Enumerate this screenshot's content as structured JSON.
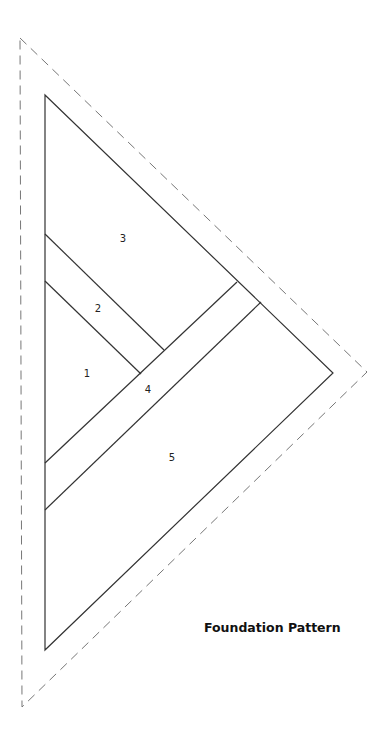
{
  "title": "Foundation Pattern",
  "colors": {
    "outline": "#333333",
    "seam_allowance": "#777777",
    "background": "#ffffff",
    "title_text": "#111111"
  },
  "outer_seam_allowance": {
    "style": "dashed",
    "points": "20,38 367,372 22,707"
  },
  "finished_outline": {
    "style": "solid",
    "points": "45,95 333,373 45,650"
  },
  "seam_lines": [
    {
      "id": "seam-3-2",
      "x1": 45,
      "y1": 234,
      "x2": 164,
      "y2": 350
    },
    {
      "id": "seam-2-1",
      "x1": 45,
      "y1": 281,
      "x2": 141,
      "y2": 374
    },
    {
      "id": "seam-1-4",
      "x1": 45,
      "y1": 463,
      "x2": 237,
      "y2": 282
    },
    {
      "id": "seam-4-5",
      "x1": 45,
      "y1": 510,
      "x2": 261,
      "y2": 302
    }
  ],
  "pieces": [
    {
      "number": "1",
      "x": 87,
      "y": 374
    },
    {
      "number": "2",
      "x": 98,
      "y": 309
    },
    {
      "number": "3",
      "x": 123,
      "y": 239
    },
    {
      "number": "4",
      "x": 148,
      "y": 390
    },
    {
      "number": "5",
      "x": 172,
      "y": 458
    }
  ]
}
